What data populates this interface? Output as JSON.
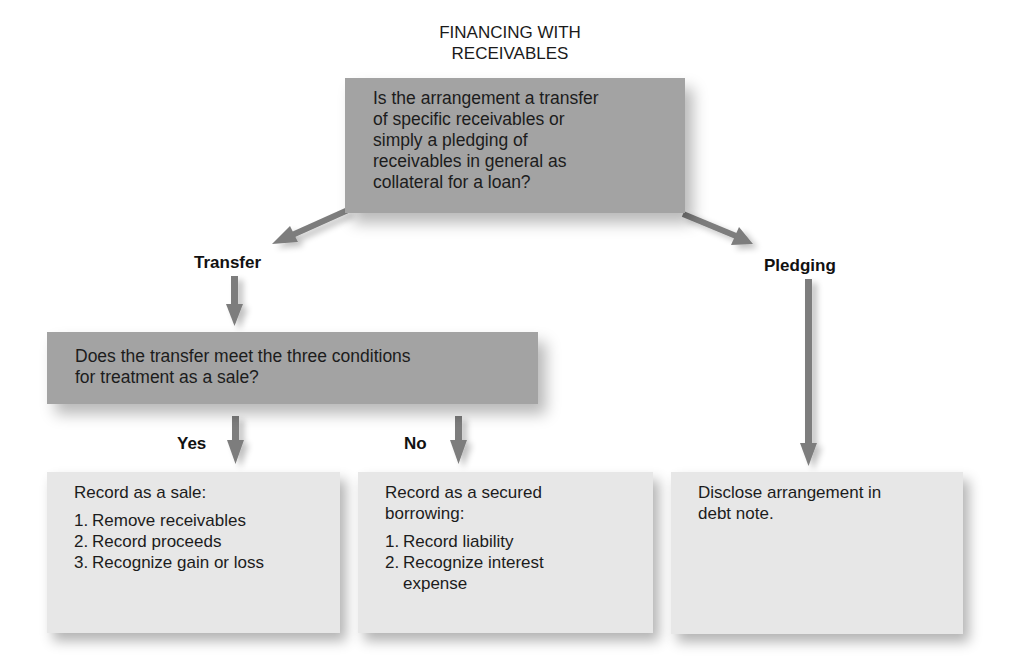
{
  "title": {
    "line1": "FINANCING WITH",
    "line2": "RECEIVABLES"
  },
  "question1": {
    "text": "Is the arrangement a transfer of specific receivables or simply a pledging of receivables in general as collateral for a loan?",
    "lines": [
      "Is the arrangement a transfer",
      "of specific receivables or",
      "simply a pledging of",
      "receivables in general as",
      "collateral for a loan?"
    ]
  },
  "branches": {
    "transfer": "Transfer",
    "pledging": "Pledging"
  },
  "question2": {
    "lines": [
      "Does the transfer meet the three conditions",
      "for treatment as a sale?"
    ]
  },
  "answers": {
    "yes": "Yes",
    "no": "No"
  },
  "outcomes": {
    "sale": {
      "title": "Record as a sale:",
      "items": [
        {
          "num": "1.",
          "text": "Remove receivables"
        },
        {
          "num": "2.",
          "text": "Record proceeds"
        },
        {
          "num": "3.",
          "text": "Recognize gain or loss"
        }
      ]
    },
    "secured_borrowing": {
      "title_lines": [
        "Record as a secured",
        "borrowing:"
      ],
      "items": [
        {
          "num": "1.",
          "text": "Record liability"
        },
        {
          "num": "2.",
          "text": "Recognize interest expense",
          "lines": [
            "Recognize interest",
            "expense"
          ]
        }
      ]
    },
    "pledging": {
      "lines": [
        "Disclose arrangement in",
        "debt note."
      ]
    }
  },
  "colors": {
    "question_box": "#a3a3a3",
    "outcome_box": "#e7e7e7",
    "arrow": "#7d7d7d",
    "text": "#1c1c1c"
  }
}
